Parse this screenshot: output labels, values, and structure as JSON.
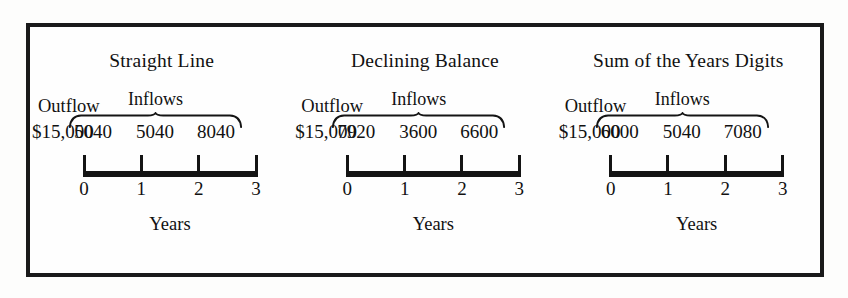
{
  "figure": {
    "border_color": "#1a1a1a",
    "ink_color": "#141414",
    "background_color": "#fefefe",
    "axis_caption": "Years",
    "inflows_label": "Inflows",
    "outflow_label": "Outflow",
    "year_ticks": [
      "0",
      "1",
      "2",
      "3"
    ]
  },
  "chart_data": {
    "type": "table",
    "xlabel": "Years",
    "ylabel": "",
    "categories": [
      "0",
      "1",
      "2",
      "3"
    ],
    "legend": [
      "Outflow",
      "Inflows"
    ],
    "annotations": [
      "Outflow",
      "Inflows",
      "Years"
    ],
    "series": [
      {
        "name": "Straight Line",
        "outflow": "$15,000",
        "outflow_value": 15000,
        "inflows": [
          "5040",
          "5040",
          "8040"
        ],
        "inflow_values": [
          5040,
          5040,
          8040
        ],
        "values": [
          -15000,
          5040,
          5040,
          8040
        ]
      },
      {
        "name": "Declining Balance",
        "outflow": "$15,000",
        "outflow_value": 15000,
        "inflows": [
          "7920",
          "3600",
          "6600"
        ],
        "inflow_values": [
          7920,
          3600,
          6600
        ],
        "values": [
          -15000,
          7920,
          3600,
          6600
        ]
      },
      {
        "name": "Sum of the Years Digits",
        "outflow": "$15,000",
        "outflow_value": 15000,
        "inflows": [
          "6000",
          "5040",
          "7080"
        ],
        "inflow_values": [
          6000,
          5040,
          7080
        ],
        "values": [
          -15000,
          6000,
          5040,
          7080
        ]
      }
    ]
  },
  "panels": [
    {
      "title": "Straight Line",
      "inflows_label": "Inflows",
      "outflow_label": "Outflow",
      "outflow_amount": "$15,000",
      "inflows": [
        "5040",
        "5040",
        "8040"
      ],
      "years": [
        "0",
        "1",
        "2",
        "3"
      ],
      "axis_caption": "Years"
    },
    {
      "title": "Declining Balance",
      "inflows_label": "Inflows",
      "outflow_label": "Outflow",
      "outflow_amount": "$15,000",
      "inflows": [
        "7920",
        "3600",
        "6600"
      ],
      "years": [
        "0",
        "1",
        "2",
        "3"
      ],
      "axis_caption": "Years"
    },
    {
      "title": "Sum of the Years Digits",
      "inflows_label": "Inflows",
      "outflow_label": "Outflow",
      "outflow_amount": "$15,000",
      "inflows": [
        "6000",
        "5040",
        "7080"
      ],
      "years": [
        "0",
        "1",
        "2",
        "3"
      ],
      "axis_caption": "Years"
    }
  ]
}
